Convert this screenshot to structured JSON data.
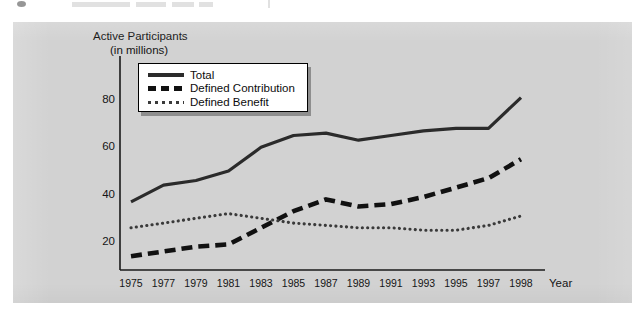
{
  "chart_data": {
    "type": "line",
    "title": "Active Participants",
    "subtitle": "(in millions)",
    "ylabel": "Active Participants (in millions)",
    "xlabel": "Year",
    "grid": false,
    "legend_position": "upper-left-inside",
    "ylim": [
      0,
      90
    ],
    "y_ticks": [
      20,
      40,
      60,
      80
    ],
    "xlim": [
      1975,
      1998
    ],
    "categories": [
      "1975",
      "1977",
      "1979",
      "1981",
      "1983",
      "1985",
      "1987",
      "1989",
      "1991",
      "1993",
      "1995",
      "1997",
      "1998"
    ],
    "x_tick_labels": [
      "1975",
      "1977",
      "1979",
      "1981",
      "1983",
      "1985",
      "1987",
      "1989",
      "1991",
      "1993",
      "1995",
      "1997",
      "1998"
    ],
    "series": [
      {
        "name": "Total",
        "style": "solid",
        "color": "#2b2b2b",
        "values": [
          37,
          44,
          46,
          50,
          60,
          65,
          66,
          63,
          65,
          67,
          68,
          68,
          81
        ]
      },
      {
        "name": "Defined Contribution",
        "style": "dashed",
        "color": "#111111",
        "values": [
          14,
          16,
          18,
          19,
          26,
          33,
          38,
          35,
          36,
          39,
          43,
          47,
          55
        ]
      },
      {
        "name": "Defined Benefit",
        "style": "dotted",
        "color": "#3a3a3a",
        "values": [
          26,
          28,
          30,
          32,
          30,
          28,
          27,
          26,
          26,
          25,
          25,
          27,
          31
        ]
      }
    ]
  },
  "axis": {
    "y_title_line1": "Active Participants",
    "y_title_line2": "(in millions)",
    "x_name": "Year",
    "y_ticks": [
      "80",
      "60",
      "40",
      "20"
    ],
    "x_ticks": [
      "1975",
      "1977",
      "1979",
      "1981",
      "1983",
      "1985",
      "1987",
      "1989",
      "1991",
      "1993",
      "1995",
      "1997",
      "1998"
    ]
  },
  "legend": {
    "items": [
      {
        "label": "Total",
        "style": "solid"
      },
      {
        "label": "Defined Contribution",
        "style": "dashed"
      },
      {
        "label": "Defined Benefit",
        "style": "dotted"
      }
    ]
  },
  "colors": {
    "panel_background": "#d2d2d2",
    "axis_line": "#1a1a1a",
    "total_line": "#2b2b2b",
    "defined_contribution_line": "#111111",
    "defined_benefit_line": "#3a3a3a",
    "legend_background": "#ffffff",
    "legend_shadow": "#8e8e8e"
  }
}
